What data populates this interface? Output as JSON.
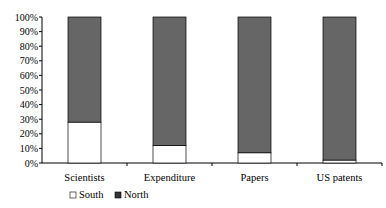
{
  "chart_data": {
    "type": "bar",
    "stacked": true,
    "title": "",
    "xlabel": "",
    "ylabel": "",
    "categories": [
      "Scientists",
      "Expenditure",
      "Papers",
      "US patents"
    ],
    "series": [
      {
        "name": "South",
        "values": [
          28,
          12,
          7,
          2
        ],
        "color": "#ffffff"
      },
      {
        "name": "North",
        "values": [
          72,
          88,
          93,
          98
        ],
        "color": "#666666"
      }
    ],
    "ylim": [
      0,
      100
    ],
    "yticks": [
      "0%",
      "10%",
      "20%",
      "30%",
      "40%",
      "50%",
      "60%",
      "70%",
      "80%",
      "90%",
      "100%"
    ],
    "legend": "bottom-left"
  }
}
